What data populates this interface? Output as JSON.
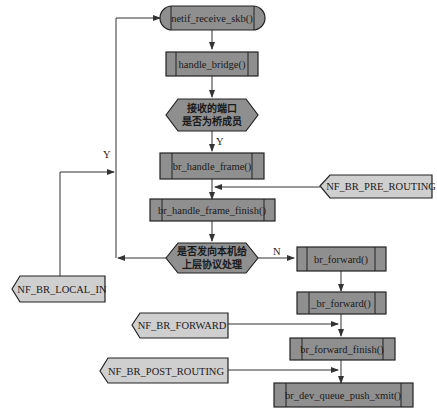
{
  "diagram": {
    "type": "flowchart",
    "nodes": {
      "netif_receive_skb": "netif_receive_skb()",
      "handle_bridge": "handle_bridge()",
      "decision_bridge_member_line1": "接收的端口",
      "decision_bridge_member_line2": "是否为桥成员",
      "br_handle_frame": "br_handle_frame()",
      "br_handle_frame_finish": "br_handle_frame_finish()",
      "decision_local_line1": "是否发向本机给",
      "decision_local_line2": "上层协议处理",
      "br_forward": "br_forward()",
      "__br_forward": "_br_forward()",
      "br_forward_finish": "br_forward_finish()",
      "br_dev_queue_push_xmit": "br_dev_queue_push_xmit()"
    },
    "hooks": {
      "pre_routing": "NF_BR_PRE_ROUTING",
      "local_in": "NF_BR_LOCAL_IN",
      "forward": "NF_BR_FORWARD",
      "post_routing": "NF_BR_POST_ROUTING"
    },
    "labels": {
      "yes_member": "Y",
      "yes_local": "Y",
      "no_local": "N"
    },
    "colors": {
      "process_fill": "#8f8f8f",
      "hook_fill": "#cfcfcf",
      "stroke": "#222222"
    }
  }
}
